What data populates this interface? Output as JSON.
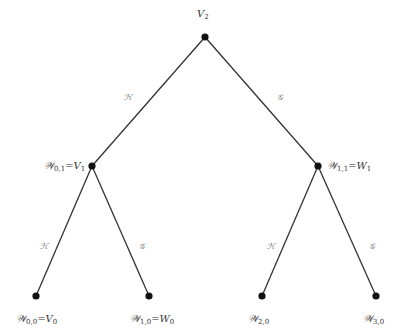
{
  "diagram": {
    "type": "binary-tree",
    "nodes": [
      {
        "id": "root",
        "x": 205,
        "y": 37,
        "label_main": "V",
        "label_sub": "2",
        "label_rest": "",
        "label_rest_sub": "",
        "label_x": 197,
        "label_y": 9
      },
      {
        "id": "w01",
        "x": 92,
        "y": 166,
        "label_main": "𝒲",
        "label_sub": "0,1",
        "label_rest": "=V",
        "label_rest_sub": "1",
        "label_x": 44,
        "label_y": 161
      },
      {
        "id": "w11",
        "x": 318,
        "y": 166,
        "label_main": "𝒲",
        "label_sub": "1,1",
        "label_rest": "=W",
        "label_rest_sub": "1",
        "label_x": 327,
        "label_y": 161
      },
      {
        "id": "w00",
        "x": 36,
        "y": 296,
        "label_main": "𝒲",
        "label_sub": "0,0",
        "label_rest": "=V",
        "label_rest_sub": "0",
        "label_x": 16,
        "label_y": 314
      },
      {
        "id": "w10",
        "x": 149,
        "y": 296,
        "label_main": "𝒲",
        "label_sub": "1,0",
        "label_rest": "=W",
        "label_rest_sub": "0",
        "label_x": 130,
        "label_y": 314
      },
      {
        "id": "w20",
        "x": 262,
        "y": 296,
        "label_main": "𝒲",
        "label_sub": "2,0",
        "label_rest": "",
        "label_rest_sub": "",
        "label_x": 248,
        "label_y": 314
      },
      {
        "id": "w30",
        "x": 376,
        "y": 296,
        "label_main": "𝒲",
        "label_sub": "3,0",
        "label_rest": "",
        "label_rest_sub": "",
        "label_x": 363,
        "label_y": 314
      }
    ],
    "edges": [
      {
        "from": "root",
        "to": "w01",
        "label": "ℋ",
        "label_x": 124,
        "label_y": 94
      },
      {
        "from": "root",
        "to": "w11",
        "label": "𝒢",
        "label_x": 277,
        "label_y": 94
      },
      {
        "from": "w01",
        "to": "w00",
        "label": "ℋ",
        "label_x": 40,
        "label_y": 243
      },
      {
        "from": "w01",
        "to": "w10",
        "label": "𝒢",
        "label_x": 139,
        "label_y": 243
      },
      {
        "from": "w11",
        "to": "w20",
        "label": "ℋ",
        "label_x": 267,
        "label_y": 243
      },
      {
        "from": "w11",
        "to": "w30",
        "label": "𝒢",
        "label_x": 369,
        "label_y": 243
      }
    ],
    "colors": {
      "line": "#333333",
      "node": "#111111",
      "edge_label": "#666666",
      "node_label": "#333333"
    }
  }
}
